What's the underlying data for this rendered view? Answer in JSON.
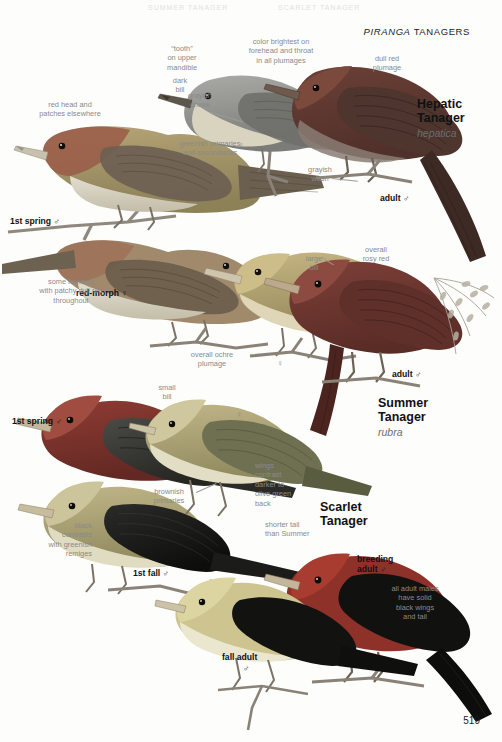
{
  "page": {
    "folio": "519",
    "running_head_genus": "PIRANGA",
    "running_head_rest": " TANAGERS",
    "ghost_text_1": "SUMMER TANAGER",
    "ghost_text_2": "SCARLET TANAGER"
  },
  "species": [
    {
      "id": "hepatic",
      "common_line1": "Hepatic",
      "common_line2": "Tanager",
      "scientific": "hepatica"
    },
    {
      "id": "summer",
      "common_line1": "Summer",
      "common_line2": "Tanager",
      "scientific": "rubra"
    },
    {
      "id": "scarlet",
      "common_line1": "Scarlet",
      "common_line2": "Tanager",
      "scientific": ""
    }
  ],
  "plumage_labels": [
    {
      "id": "hepatic-1st-spring-male",
      "text": "1st spring ♂"
    },
    {
      "id": "hepatic-adult-male",
      "text": "adult ♂"
    },
    {
      "id": "hepatic-red-morph-female",
      "text": "red-morph ♀"
    },
    {
      "id": "summer-adult-male",
      "text": "adult ♂"
    },
    {
      "id": "scarlet-1st-spring-male",
      "text": "1st spring ♂"
    },
    {
      "id": "scarlet-1st-fall-male",
      "text": "1st fall ♂"
    },
    {
      "id": "scarlet-breeding-adult-male-l1",
      "text": "breeding"
    },
    {
      "id": "scarlet-breeding-adult-male-l2",
      "text": "adult ♂"
    },
    {
      "id": "scarlet-fall-adult-l1",
      "text": "fall adult"
    },
    {
      "id": "scarlet-fall-adult-l2",
      "text": "♂"
    }
  ],
  "notes": [
    {
      "id": "tooth-mandible",
      "text": "“tooth”\non upper\nmandible"
    },
    {
      "id": "dark-bill",
      "text": "dark\nbill"
    },
    {
      "id": "grayish-cheek",
      "text": "grayish\ncheek"
    },
    {
      "id": "color-brightest",
      "text": "color brightest on\nforehead and throat\nin all plumages"
    },
    {
      "id": "dull-red-plumage",
      "text": "dull red\nplumage"
    },
    {
      "id": "red-head-patches",
      "text": "red head and\npatches elsewhere"
    },
    {
      "id": "greenish-primaries",
      "text": "greenish primaries\nand secondaries"
    },
    {
      "id": "grayish-wash",
      "text": "grayish\nwash"
    },
    {
      "id": "patchy-dull-red",
      "text": "some females\nwith patchy dull red\nthroughout"
    },
    {
      "id": "large-bill",
      "text": "large\nbill"
    },
    {
      "id": "overall-rosy-red",
      "text": "overall\nrosy red"
    },
    {
      "id": "overall-ochre",
      "text": "overall ochre\nplumage"
    },
    {
      "id": "small-bill",
      "text": "small\nbill"
    },
    {
      "id": "brownish-primaries",
      "text": "brownish\nprimaries"
    },
    {
      "id": "black-contrasts",
      "text": "black\ncontrasts\nwith greenish\nremiges"
    },
    {
      "id": "wings-contrast",
      "text": "wings\ncontrast\ndarker to\nolive green\nback"
    },
    {
      "id": "shorter-tail",
      "text": "shorter tail\nthan Summer"
    },
    {
      "id": "solid-black-wings",
      "text": "all adult males\nhave solid\nblack wings\nand tail"
    }
  ],
  "sex_marks": [
    {
      "id": "hepatic-female-mark",
      "text": "♀"
    },
    {
      "id": "summer-female-mark",
      "text": "♀"
    },
    {
      "id": "scarlet-female-mark",
      "text": "♀"
    }
  ],
  "colors": {
    "plate_background": "#fdfdfc",
    "note_text": "#8a8a8a",
    "label_text": "#111111",
    "scientific_text": "#6d6d6d",
    "hepatic_red": "#8d5347",
    "summer_red": "#a3443a",
    "scarlet_red": "#b8352c",
    "olive_female": "#b9a96e",
    "wing_dark": "#3a3a3a",
    "black_wing": "#161616"
  }
}
